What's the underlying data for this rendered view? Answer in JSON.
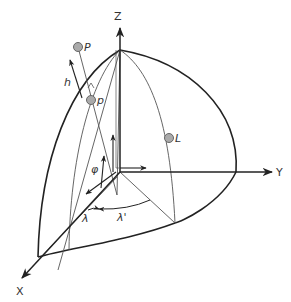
{
  "diagram": {
    "type": "spherical-coordinate-geometry",
    "colors": {
      "stroke_dark": "#222222",
      "stroke_light": "#555555",
      "point_fill": "#aaaaaa",
      "point_stroke": "#666666",
      "background": "#ffffff"
    },
    "axes": {
      "x_label": "X",
      "y_label": "Y",
      "z_label": "Z"
    },
    "points": {
      "P_label": "P",
      "p_label": "p",
      "L_label": "L"
    },
    "angles": {
      "h_label": "h",
      "phi_label": "φ",
      "lambda_label": "λ",
      "lambda_prime_label": "λ'"
    }
  }
}
